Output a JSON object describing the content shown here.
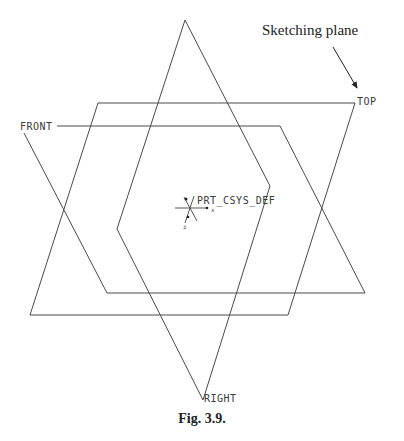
{
  "diagram": {
    "annotation": "Sketching plane",
    "caption": "Fig. 3.9.",
    "datum_planes": {
      "front": "FRONT",
      "top": "TOP",
      "right": "RIGHT"
    },
    "coordinate_system": {
      "label": "PRT_CSYS_DEF",
      "axes": [
        "x",
        "y",
        "z"
      ]
    },
    "colors": {
      "line": "#4a4a4a",
      "text": "#3a3a3a",
      "background": "#ffffff"
    }
  }
}
